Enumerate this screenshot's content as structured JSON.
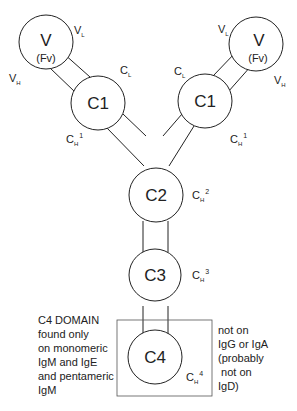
{
  "domains": {
    "v_left": {
      "label": "V",
      "sublabel": "(Fv)"
    },
    "v_right": {
      "label": "V",
      "sublabel": "(Fv)"
    },
    "c1_left": {
      "label": "C1"
    },
    "c1_right": {
      "label": "C1"
    },
    "c2": {
      "label": "C2"
    },
    "c3": {
      "label": "C3"
    },
    "c4": {
      "label": "C4"
    }
  },
  "side_labels": {
    "vl_main": "V",
    "vl_sub": "L",
    "vh_main": "V",
    "vh_sub": "H",
    "cl_main": "C",
    "cl_sub": "L",
    "ch_main": "C",
    "ch_sub": "H",
    "ch1_sup": "1",
    "ch2_sup": "2",
    "ch3_sup": "3",
    "ch4_sup": "4"
  },
  "notes": {
    "left": [
      "C4 DOMAIN",
      "found only",
      "on monomeric",
      "IgM and IgE",
      "and pentameric",
      "IgM"
    ],
    "right": [
      "not on",
      "IgG or IgA",
      "(probably",
      " not on",
      "IgD)"
    ]
  },
  "colors": {
    "stroke": "#222222",
    "text": "#222222",
    "background": "#ffffff"
  }
}
